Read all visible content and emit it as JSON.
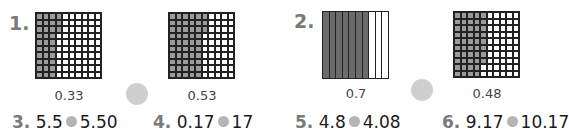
{
  "exercises": [
    {
      "label": "1.",
      "grids": [
        {
          "type": "hundredths",
          "value_label": "0.33",
          "full_columns": 3,
          "extra_cells": 3
        },
        {
          "type": "hundredths",
          "value_label": "0.53",
          "full_columns": 5,
          "extra_cells": 3
        }
      ]
    },
    {
      "label": "2.",
      "grids": [
        {
          "type": "tenths",
          "value_label": "0.7",
          "shaded_strips": 7
        },
        {
          "type": "hundredths",
          "value_label": "0.48",
          "full_columns": 4,
          "extra_cells": 8
        }
      ]
    }
  ],
  "comparisons": [
    {
      "label": "3.",
      "left": "5.5",
      "right": "5.50"
    },
    {
      "label": "4.",
      "left": "0.17",
      "right": "17"
    },
    {
      "label": "5.",
      "left": "4.8",
      "right": "4.08"
    },
    {
      "label": "6.",
      "left": "9.17",
      "right": "10.17"
    }
  ],
  "colors": {
    "shade_light": "#9a9a9a",
    "shade_dark": "#6b6b6b",
    "circle": "#cfcfcf",
    "number": "#7a7a7a"
  }
}
